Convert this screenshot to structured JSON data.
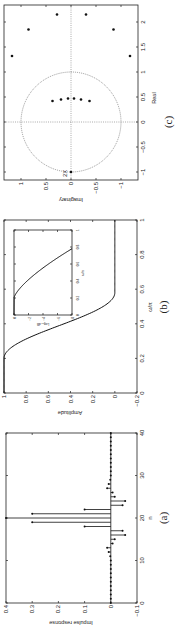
{
  "figure": {
    "orientation": "rotated 90 degrees counter-clockwise",
    "panels": [
      "(a)",
      "(b)",
      "(c)"
    ]
  },
  "chart_data": [
    {
      "panel": "(a)",
      "type": "scatter",
      "subtype": "stem",
      "caption": "(a)",
      "xlabel": "n",
      "ylabel": "Impulse response",
      "xlim": [
        0,
        40
      ],
      "ylim": [
        -0.1,
        0.4
      ],
      "xticks": [
        "0",
        "10",
        "20",
        "30",
        "40"
      ],
      "yticks": [
        "-0.1",
        "0",
        "0.1",
        "0.2",
        "0.3",
        "0.4"
      ],
      "grid": false,
      "x": [
        0,
        1,
        2,
        3,
        4,
        5,
        6,
        7,
        8,
        9,
        10,
        11,
        12,
        13,
        14,
        15,
        16,
        17,
        18,
        19,
        20,
        21,
        22,
        23,
        24,
        25,
        26,
        27,
        28,
        29,
        30,
        31,
        32,
        33,
        34,
        35,
        36,
        37,
        38,
        39,
        40
      ],
      "values": [
        0,
        0,
        0,
        0,
        0,
        0,
        0,
        0,
        0,
        0,
        0,
        0.002,
        0.008,
        0.014,
        -0.007,
        -0.015,
        -0.055,
        -0.045,
        0.1,
        0.3,
        0.4,
        0.3,
        0.1,
        -0.045,
        -0.055,
        -0.015,
        -0.007,
        0.014,
        0.008,
        0.002,
        0,
        0,
        0,
        0,
        0,
        0,
        0,
        0,
        0,
        0,
        0
      ]
    },
    {
      "panel": "(b)",
      "type": "line",
      "caption": "(b)",
      "xlabel": "ω/π",
      "ylabel": "Amplitude",
      "xlim": [
        0,
        1
      ],
      "ylim": [
        -0.2,
        1
      ],
      "xticks": [
        "0",
        "0.2",
        "0.4",
        "0.6",
        "0.8",
        "1"
      ],
      "yticks": [
        "-0.2",
        "0",
        "0.2",
        "0.4",
        "0.6",
        "0.8",
        "1"
      ],
      "grid": false,
      "x": [
        0,
        0.1,
        0.2,
        0.25,
        0.3,
        0.35,
        0.4,
        0.45,
        0.5,
        0.55,
        0.6,
        0.7,
        0.8,
        0.9,
        1.0
      ],
      "values": [
        1,
        1,
        0.99,
        0.96,
        0.85,
        0.65,
        0.4,
        0.18,
        0.05,
        0.01,
        0,
        0,
        0,
        0,
        0
      ],
      "inset": {
        "type": "line",
        "xlabel": "ω/π",
        "ylabel": "Log₁₀ dB",
        "xlim": [
          0,
          1
        ],
        "xticks": [
          "0",
          "0.2",
          "0.4",
          "0.6",
          "0.8",
          "1"
        ],
        "yticks": [
          "0",
          "-2",
          "-4",
          "-6",
          "-8"
        ],
        "x": [
          0,
          0.2,
          0.3,
          0.35,
          0.4,
          0.5,
          0.6,
          0.7,
          0.75,
          0.78
        ],
        "values": [
          0,
          -0.02,
          -0.1,
          -0.3,
          -0.8,
          -2.5,
          -4.5,
          -6.5,
          -7.5,
          -8
        ]
      }
    },
    {
      "panel": "(c)",
      "type": "scatter",
      "caption": "(c)",
      "xlabel": "Real",
      "ylabel": "Imaginary",
      "xlim": [
        -1,
        2.3
      ],
      "ylim": [
        -1.2,
        1.3
      ],
      "xticks": [
        "-1",
        "-0.5",
        "0",
        "0.5",
        "1",
        "1.5",
        "2"
      ],
      "yticks": [
        "-1",
        "-0.5",
        "0",
        "0.5",
        "1"
      ],
      "grid": "dotted axes through origin",
      "unit_circle": true,
      "annotation": {
        "text": "2X",
        "at": [
          -1,
          0
        ]
      },
      "series": [
        {
          "name": "zeros",
          "points": [
            [
              -1,
              0
            ],
            [
              0.42,
              0.37
            ],
            [
              0.45,
              0.2
            ],
            [
              0.47,
              0.06
            ],
            [
              0.47,
              -0.06
            ],
            [
              0.45,
              -0.2
            ],
            [
              0.42,
              -0.37
            ],
            [
              1.32,
              1.18
            ],
            [
              1.32,
              -1.18
            ],
            [
              1.85,
              0.85
            ],
            [
              1.85,
              -0.85
            ],
            [
              2.15,
              0.28
            ],
            [
              2.15,
              -0.3
            ]
          ]
        }
      ]
    }
  ],
  "labels": {
    "a": {
      "caption": "(a)",
      "xlabel": "n",
      "ylabel": "Impulse response"
    },
    "b": {
      "caption": "(b)",
      "xlabel": "ω/π",
      "ylabel": "Amplitude",
      "inset_xlabel": "ω/π",
      "inset_ylabel": "Log₁₀ dB"
    },
    "c": {
      "caption": "(c)",
      "xlabel": "Real",
      "ylabel": "Imaginary",
      "annotation": "2X"
    }
  }
}
